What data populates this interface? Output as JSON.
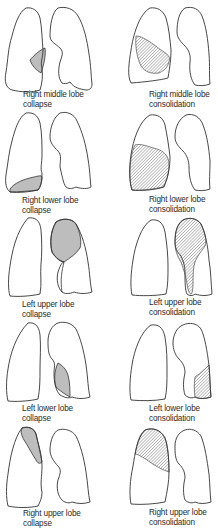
{
  "diagram": {
    "colors": {
      "outline": "#333333",
      "collapse_fill": "#bdbdbd",
      "hatch": "#777777",
      "background": "#ffffff"
    },
    "legend": {
      "collapse": "solid grey fill",
      "consolidation": "diagonal hatched fill"
    },
    "panels": [
      {
        "row": 1,
        "col": 1,
        "type": "collapse",
        "lobe": "Right middle lobe",
        "caption_line1": "Right middle lobe",
        "caption_line2": "collapse"
      },
      {
        "row": 1,
        "col": 2,
        "type": "consolidation",
        "lobe": "Right middle lobe",
        "caption_line1": "Right middle lobe",
        "caption_line2": "consolidation"
      },
      {
        "row": 2,
        "col": 1,
        "type": "collapse",
        "lobe": "Right lower lobe",
        "caption_line1": "Right lower lobe",
        "caption_line2": "collapse"
      },
      {
        "row": 2,
        "col": 2,
        "type": "consolidation",
        "lobe": "Right lower lobe",
        "caption_line1": "Right lower lobe",
        "caption_line2": "consolidation"
      },
      {
        "row": 3,
        "col": 1,
        "type": "collapse",
        "lobe": "Left upper lobe",
        "caption_line1": "Left upper lobe",
        "caption_line2": "collapse"
      },
      {
        "row": 3,
        "col": 2,
        "type": "consolidation",
        "lobe": "Left upper lobe",
        "caption_line1": "Left upper lobe",
        "caption_line2": "consolidation"
      },
      {
        "row": 4,
        "col": 1,
        "type": "collapse",
        "lobe": "Left lower lobe",
        "caption_line1": "Left lower lobe",
        "caption_line2": "collapse"
      },
      {
        "row": 4,
        "col": 2,
        "type": "consolidation",
        "lobe": "Left lower lobe",
        "caption_line1": "Left lower lobe",
        "caption_line2": "consolidation"
      },
      {
        "row": 5,
        "col": 1,
        "type": "collapse",
        "lobe": "Right upper lobe",
        "caption_line1": "Right upper lobe",
        "caption_line2": "collapse"
      },
      {
        "row": 5,
        "col": 2,
        "type": "consolidation",
        "lobe": "Right upper lobe",
        "caption_line1": "Right upper lobe",
        "caption_line2": "consolidation"
      }
    ]
  }
}
